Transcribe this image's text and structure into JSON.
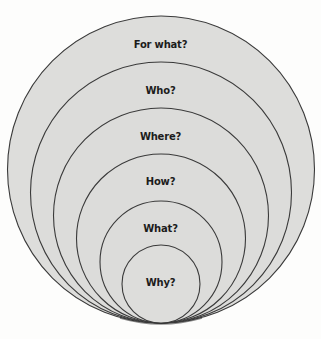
{
  "diagram": {
    "type": "nested-tangent-circles",
    "fill_color": "#dcdcda",
    "stroke_color": "#3a3a3a",
    "background": "#fdfdfc",
    "layers": [
      {
        "label": "For what?",
        "order": 1
      },
      {
        "label": "Who?",
        "order": 2
      },
      {
        "label": "Where?",
        "order": 3
      },
      {
        "label": "How?",
        "order": 4
      },
      {
        "label": "What?",
        "order": 5
      },
      {
        "label": "Why?",
        "order": 6
      }
    ]
  }
}
